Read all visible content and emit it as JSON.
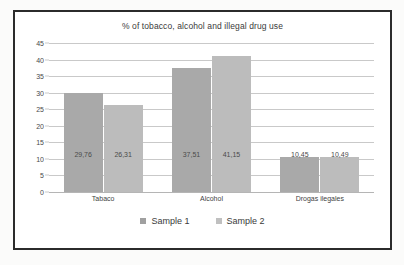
{
  "chart_data": {
    "type": "bar",
    "title": "% of tobacco, alcohol and illegal drug use",
    "xlabel": "",
    "ylabel": "",
    "ylim": [
      0,
      45
    ],
    "ytick_step": 5,
    "grid": true,
    "legend_position": "bottom",
    "categories": [
      "Tabaco",
      "Alcohol",
      "Drogas ilegales"
    ],
    "ytick_labels": [
      "0",
      "5",
      "10",
      "15",
      "20",
      "25",
      "30",
      "35",
      "40",
      "45"
    ],
    "series": [
      {
        "name": "Sample 1",
        "color": "#a9a9a9",
        "values": [
          29.76,
          26.31,
          10.45
        ],
        "value_labels": [
          "29,76",
          "37,51",
          "10,45"
        ]
      },
      {
        "name": "Sample 2",
        "color": "#bcbcbc",
        "values": [
          26.31,
          41.15,
          10.49
        ],
        "value_labels": [
          "26,31",
          "41,15",
          "10,49"
        ]
      }
    ],
    "points": [
      {
        "category": "Tabaco",
        "series": "Sample 1",
        "value": 29.76,
        "label": "29,76"
      },
      {
        "category": "Tabaco",
        "series": "Sample 2",
        "value": 26.31,
        "label": "26,31"
      },
      {
        "category": "Alcohol",
        "series": "Sample 1",
        "value": 37.51,
        "label": "37,51"
      },
      {
        "category": "Alcohol",
        "series": "Sample 2",
        "value": 41.15,
        "label": "41,15"
      },
      {
        "category": "Drogas ilegales",
        "series": "Sample 1",
        "value": 10.45,
        "label": "10,45"
      },
      {
        "category": "Drogas ilegales",
        "series": "Sample 2",
        "value": 10.49,
        "label": "10,49"
      }
    ]
  },
  "legend": {
    "items": [
      {
        "label": "Sample 1",
        "color": "#a0a0a0"
      },
      {
        "label": "Sample 2",
        "color": "#c0c0c0"
      }
    ]
  },
  "colors": {
    "frame": "#2b2b2b",
    "grid": "#c9c9c9",
    "text": "#3a3a3a",
    "series_1": "#a9a9a9",
    "series_2": "#bcbcbc"
  }
}
